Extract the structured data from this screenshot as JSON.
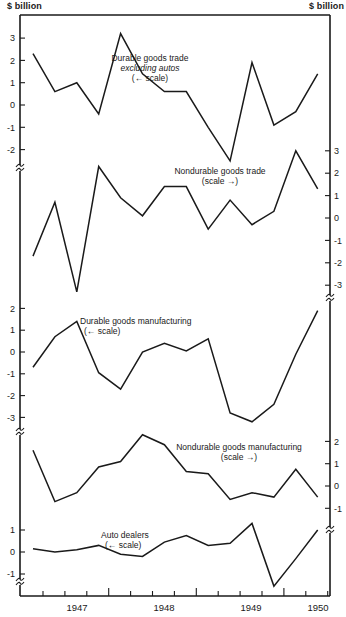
{
  "units": {
    "left": "$ billion",
    "right": "$ billion"
  },
  "x_axis": {
    "labels": [
      {
        "text": "1947",
        "x": 77
      },
      {
        "text": "1948",
        "x": 164
      },
      {
        "text": "1949",
        "x": 251
      },
      {
        "text": "1950",
        "x": 318
      }
    ]
  },
  "chart_data": {
    "type": "line",
    "title": "",
    "xlabel": "",
    "ylabel": "$ billion",
    "x": [
      "1946 Q3",
      "1946 Q4",
      "1947 Q1",
      "1947 Q2",
      "1947 Q3",
      "1947 Q4",
      "1948 Q1",
      "1948 Q2",
      "1948 Q3",
      "1948 Q4",
      "1949 Q1",
      "1949 Q2",
      "1949 Q3",
      "1949 Q4"
    ],
    "x_tick_labels": [
      "1947",
      "1948",
      "1949",
      "1950"
    ],
    "grid": false,
    "series": [
      {
        "name": "Durable goods trade excluding autos",
        "label_lines": [
          "Durable goods trade",
          "excluding autos",
          "(← scale)"
        ],
        "scale": "left",
        "ylim": [
          -2.5,
          3.5
        ],
        "ticks": [
          3,
          2,
          1,
          0,
          -1,
          -2
        ],
        "values": [
          2.3,
          0.6,
          1.0,
          -0.4,
          3.2,
          1.4,
          0.6,
          0.6,
          -1.0,
          -2.5,
          1.9,
          -0.9,
          -0.3,
          1.4
        ]
      },
      {
        "name": "Nondurable goods trade",
        "label_lines": [
          "Nondurable goods trade",
          "(scale →)"
        ],
        "scale": "right",
        "ylim": [
          -3.5,
          3.2
        ],
        "ticks": [
          3,
          2,
          1,
          0,
          -1,
          -2,
          -3
        ],
        "values": [
          -1.7,
          0.7,
          -3.3,
          2.3,
          0.9,
          0.1,
          1.4,
          1.4,
          -0.5,
          0.8,
          -0.3,
          0.3,
          3.0,
          1.3
        ]
      },
      {
        "name": "Durable goods manufacturing",
        "label_lines": [
          "Durable goods manufacturing",
          "(← scale)"
        ],
        "scale": "left",
        "ylim": [
          -3.5,
          2.2
        ],
        "ticks": [
          2,
          1,
          0,
          -1,
          -2,
          -3
        ],
        "values": [
          -0.7,
          0.7,
          1.4,
          -0.95,
          -1.7,
          0.0,
          0.4,
          0.05,
          0.6,
          -2.8,
          -3.2,
          -2.4,
          -0.1,
          1.9
        ]
      },
      {
        "name": "Nondurable goods manufacturing",
        "label_lines": [
          "Nondurable goods manufacturing",
          "(scale →)"
        ],
        "scale": "right",
        "ylim": [
          -1.5,
          2.5
        ],
        "ticks": [
          2,
          1,
          0,
          -1
        ],
        "values": [
          1.6,
          -0.7,
          -0.3,
          0.85,
          1.1,
          2.3,
          1.85,
          0.65,
          0.55,
          -0.6,
          -0.3,
          -0.5,
          0.75,
          -0.5
        ]
      },
      {
        "name": "Auto dealers",
        "label_lines": [
          "Auto dealers",
          "(← scale)"
        ],
        "scale": "left",
        "ylim": [
          -1.5,
          1.5
        ],
        "ticks": [
          1,
          0,
          -1
        ],
        "values": [
          0.15,
          0.0,
          0.1,
          0.3,
          -0.1,
          -0.2,
          0.45,
          0.75,
          0.3,
          0.4,
          1.3,
          -1.55,
          -0.3,
          1.0
        ]
      }
    ]
  }
}
